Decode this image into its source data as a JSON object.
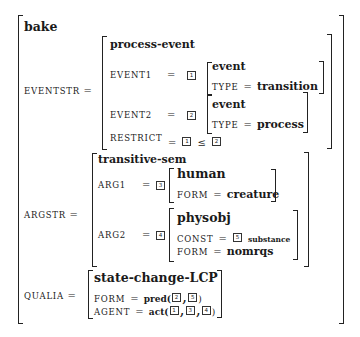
{
  "lexeme": "bake",
  "eventstr": {
    "label": "EVENTSTR",
    "eq": "=",
    "type": "process-event",
    "event1": {
      "label": "EVENT1",
      "eq": "=",
      "tag": "1",
      "type": "event",
      "feat": "TYPE",
      "feat_eq": "=",
      "value": "transition"
    },
    "event2": {
      "label": "EVENT2",
      "eq": "=",
      "tag": "2",
      "type": "event",
      "feat": "TYPE",
      "feat_eq": "=",
      "value": "process"
    },
    "restrict": {
      "label": "RESTRICT",
      "eq": "=",
      "tag_a": "1",
      "op": "≤",
      "tag_b": "2"
    }
  },
  "argstr": {
    "label": "ARGSTR",
    "eq": "=",
    "type": "transitive-sem",
    "arg1": {
      "label": "ARG1",
      "eq": "=",
      "tag": "3",
      "type": "human",
      "feat": "FORM",
      "feat_eq": "=",
      "value": "creature"
    },
    "arg2": {
      "label": "ARG2",
      "eq": "=",
      "tag": "4",
      "type": "physobj",
      "const_label": "CONST",
      "const_eq": "=",
      "const_tag": "5",
      "const_value": "substance",
      "form_label": "FORM",
      "form_eq": "=",
      "form_value": "nomrqs"
    }
  },
  "qualia": {
    "label": "QUALIA",
    "eq": "=",
    "type": "state-change-LCP",
    "form": {
      "label": "FORM",
      "eq": "=",
      "pred": "pred(",
      "tags": [
        "2",
        "5"
      ],
      "close": ")"
    },
    "agent": {
      "label": "AGENT",
      "eq": "=",
      "pred": "act(",
      "tags": [
        "1",
        "3",
        "4"
      ],
      "close": ")"
    }
  }
}
